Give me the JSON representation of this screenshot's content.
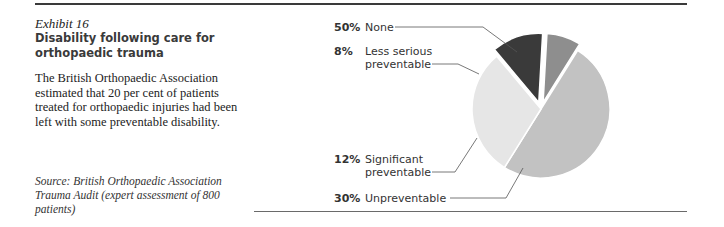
{
  "exhibit": {
    "number": "Exhibit 16",
    "title_line1": "Disability following care for",
    "title_line2": "orthopaedic trauma",
    "description": "The British Orthopaedic Association estimated that 20 per cent of patients treated for orthopaedic injuries had been left with some preventable disability.",
    "source": "Source: British Orthopaedic Association Trauma Audit (expert assessment of 800 patients)"
  },
  "labels": [
    {
      "pct": "50%",
      "line1": "None",
      "line2": ""
    },
    {
      "pct": "8%",
      "line1": "Less serious",
      "line2": "preventable"
    },
    {
      "pct": "12%",
      "line1": "Significant",
      "line2": "preventable"
    },
    {
      "pct": "30%",
      "line1": "Unpreventable",
      "line2": ""
    }
  ],
  "chart_data": {
    "type": "pie",
    "title": "Disability following care for orthopaedic trauma",
    "categories": [
      "None",
      "Less serious preventable",
      "Significant preventable",
      "Unpreventable"
    ],
    "values": [
      50,
      8,
      12,
      30
    ],
    "unit": "%",
    "colors": [
      "#c2c2c2",
      "#8e8e8e",
      "#3a3a3a",
      "#e6e6e6"
    ],
    "exploded": [
      "Less serious preventable",
      "Significant preventable"
    ],
    "legend_position": "left (leader-line labels)"
  }
}
